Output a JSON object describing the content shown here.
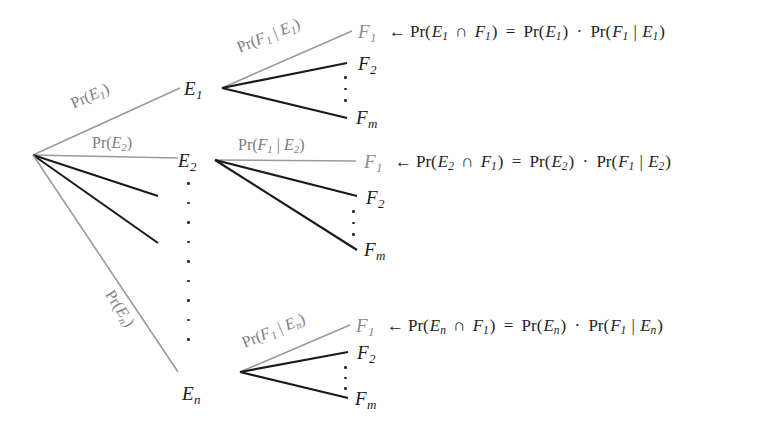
{
  "figure": {
    "type": "probability-tree-diagram",
    "background": "#ffffff",
    "colors": {
      "black_edge": "#1a1a1a",
      "gray_edge": "#9a9a9a",
      "gray_text": "#8c8c8c",
      "label_text": "#7d7d7d",
      "equation_text": "#232323"
    }
  },
  "nodes": {
    "e1": {
      "base": "E",
      "sub": "1"
    },
    "e2": {
      "base": "E",
      "sub": "2"
    },
    "en": {
      "base": "E",
      "sub": "n"
    },
    "f1": {
      "base": "F",
      "sub": "1"
    },
    "f2": {
      "base": "F",
      "sub": "2"
    },
    "fm": {
      "base": "F",
      "sub": "m"
    }
  },
  "edge_labels": {
    "pr_e1": {
      "pr": "Pr(",
      "it": "E",
      "sub": "1",
      "close": ")"
    },
    "pr_e2": {
      "pr": "Pr(",
      "it": "E",
      "sub": "2",
      "close": ")"
    },
    "pr_en": {
      "pr": "Pr(",
      "it": "E",
      "sub": "n",
      "close": ")"
    },
    "pr_f1_e1": {
      "pr": "Pr(",
      "it1": "F",
      "sub1": "1",
      "bar": " | ",
      "it2": "E",
      "sub2": "1",
      "close": ")"
    },
    "pr_f1_e2": {
      "pr": "Pr(",
      "it1": "F",
      "sub1": "1",
      "bar": " | ",
      "it2": "E",
      "sub2": "2",
      "close": ")"
    },
    "pr_f1_en": {
      "pr": "Pr(",
      "it1": "F",
      "sub1": "1",
      "bar": " | ",
      "it2": "E",
      "sub2": "n",
      "close": ")"
    }
  },
  "equations": [
    {
      "id": "eq-row-1",
      "arrow": "←",
      "lhs_pr": "Pr(",
      "lhs_e": "E",
      "lhs_e_sub": "1",
      "cap": "∩",
      "lhs_f": "F",
      "lhs_f_sub": "1",
      "lhs_close": ")",
      "equals": "=",
      "rhs1_pr": "Pr(",
      "rhs1_e": "E",
      "rhs1_e_sub": "1",
      "rhs1_close": ")",
      "dot": "·",
      "rhs2_pr": "Pr(",
      "rhs2_f": "F",
      "rhs2_f_sub": "1",
      "rhs2_bar": " | ",
      "rhs2_e": "E",
      "rhs2_e_sub": "1",
      "rhs2_close": ")"
    },
    {
      "id": "eq-row-2",
      "arrow": "←",
      "lhs_pr": "Pr(",
      "lhs_e": "E",
      "lhs_e_sub": "2",
      "cap": "∩",
      "lhs_f": "F",
      "lhs_f_sub": "1",
      "lhs_close": ")",
      "equals": "=",
      "rhs1_pr": "Pr(",
      "rhs1_e": "E",
      "rhs1_e_sub": "2",
      "rhs1_close": ")",
      "dot": "·",
      "rhs2_pr": "Pr(",
      "rhs2_f": "F",
      "rhs2_f_sub": "1",
      "rhs2_bar": " | ",
      "rhs2_e": "E",
      "rhs2_e_sub": "2",
      "rhs2_close": ")"
    },
    {
      "id": "eq-row-3",
      "arrow": "←",
      "lhs_pr": "Pr(",
      "lhs_e": "E",
      "lhs_e_sub": "n",
      "cap": "∩",
      "lhs_f": "F",
      "lhs_f_sub": "1",
      "lhs_close": ")",
      "equals": "=",
      "rhs1_pr": "Pr(",
      "rhs1_e": "E",
      "rhs1_e_sub": "n",
      "rhs1_close": ")",
      "dot": "·",
      "rhs2_pr": "Pr(",
      "rhs2_f": "F",
      "rhs2_f_sub": "1",
      "rhs2_bar": " | ",
      "rhs2_e": "E",
      "rhs2_e_sub": "n",
      "rhs2_close": ")"
    }
  ]
}
